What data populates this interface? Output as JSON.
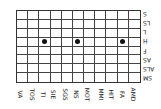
{
  "diagram": {
    "columns": [
      "VA",
      "TOS",
      "TI",
      "SIE",
      "SGS",
      "NS",
      "MOT",
      "MMI",
      "HIT",
      "FA",
      "AMD"
    ],
    "rows": [
      "S",
      "LS",
      "L",
      "H",
      "F",
      "AS",
      "ALS",
      "SM"
    ],
    "marks": [
      {
        "row": "H",
        "column": "TI"
      },
      {
        "row": "H",
        "column": "NS"
      },
      {
        "row": "H",
        "column": "FA"
      }
    ],
    "colors": {
      "grid": "#444444",
      "dot": "#111111"
    }
  }
}
